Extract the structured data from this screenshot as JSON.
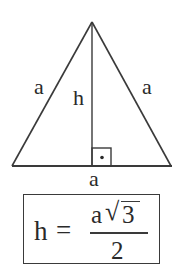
{
  "figure": {
    "type": "geometry-diagram",
    "shape": "equilateral triangle",
    "labels": {
      "left_side": "a",
      "right_side": "a",
      "base": "a",
      "height": "h"
    },
    "right_angle_marker": {
      "symbol": "•",
      "meaning": "right angle between height and base"
    },
    "formula": {
      "lhs": "h",
      "equals": "=",
      "numerator_var": "a",
      "numerator_root_symbol": "√",
      "numerator_radicand": "3",
      "denominator": "2",
      "text": "h = a√3 / 2"
    },
    "colors": {
      "stroke": "#3a3a3a",
      "text": "#2a2a2a",
      "background": "#ffffff"
    }
  }
}
